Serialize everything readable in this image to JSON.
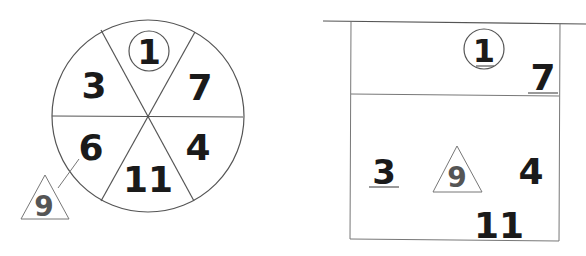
{
  "wheel": {
    "segments": [
      {
        "label": "1",
        "position": "top",
        "marker": "circle"
      },
      {
        "label": "7",
        "position": "upper-right"
      },
      {
        "label": "4",
        "position": "lower-right"
      },
      {
        "label": "11",
        "position": "bottom"
      },
      {
        "label": "6",
        "position": "lower-left"
      },
      {
        "label": "3",
        "position": "upper-left"
      }
    ],
    "callout": {
      "label": "9",
      "marker": "triangle",
      "attached_to": "6"
    }
  },
  "box": {
    "items": [
      {
        "label": "1",
        "marker": "circle",
        "underlined": true
      },
      {
        "label": "7",
        "underlined": true
      },
      {
        "label": "3",
        "underlined": true
      },
      {
        "label": "9",
        "marker": "triangle"
      },
      {
        "label": "4",
        "underlined": false
      },
      {
        "label": "11",
        "underlined": false
      }
    ]
  }
}
